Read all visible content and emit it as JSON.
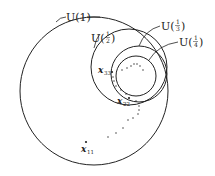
{
  "diagram": {
    "type": "nested-neighborhoods",
    "colors": {
      "stroke": "#222222",
      "background": "#ffffff"
    },
    "sets": [
      {
        "id": "U1",
        "label_prefix": "U(",
        "label_value": "1",
        "label_suffix": ")",
        "cx": 94,
        "cy": 91,
        "r": 74
      },
      {
        "id": "U1_2",
        "label_prefix": "U(",
        "numerator": "1",
        "denominator": "2",
        "label_suffix": ")",
        "cx": 129,
        "cy": 67,
        "r": 38
      },
      {
        "id": "U1_3",
        "label_prefix": "U(",
        "numerator": "1",
        "denominator": "3",
        "label_suffix": ")",
        "cx": 139,
        "cy": 74,
        "r": 28
      },
      {
        "id": "U1_4",
        "label_prefix": "U(",
        "numerator": "1",
        "denominator": "4",
        "label_suffix": ")",
        "cx": 136,
        "cy": 76,
        "r": 20
      }
    ],
    "points": [
      {
        "base": "x",
        "subscript": "11",
        "x": 85,
        "y": 142
      },
      {
        "base": "x",
        "subscript": "22",
        "x": 129,
        "y": 98
      },
      {
        "base": "x",
        "subscript": "33",
        "x": 112,
        "y": 72
      }
    ],
    "sequence_dots": [
      [
        108,
        137
      ],
      [
        116,
        133
      ],
      [
        123,
        128
      ],
      [
        128,
        120
      ],
      [
        133,
        118
      ],
      [
        138,
        114
      ],
      [
        139,
        110
      ],
      [
        139,
        106
      ],
      [
        136,
        101
      ],
      [
        126,
        94
      ],
      [
        121,
        90
      ],
      [
        116,
        86
      ],
      [
        114,
        81
      ],
      [
        113,
        77
      ],
      [
        122,
        70
      ],
      [
        127,
        68
      ],
      [
        131,
        66
      ],
      [
        134,
        64
      ],
      [
        137,
        64
      ],
      [
        140,
        66
      ],
      [
        143,
        70
      ]
    ]
  }
}
